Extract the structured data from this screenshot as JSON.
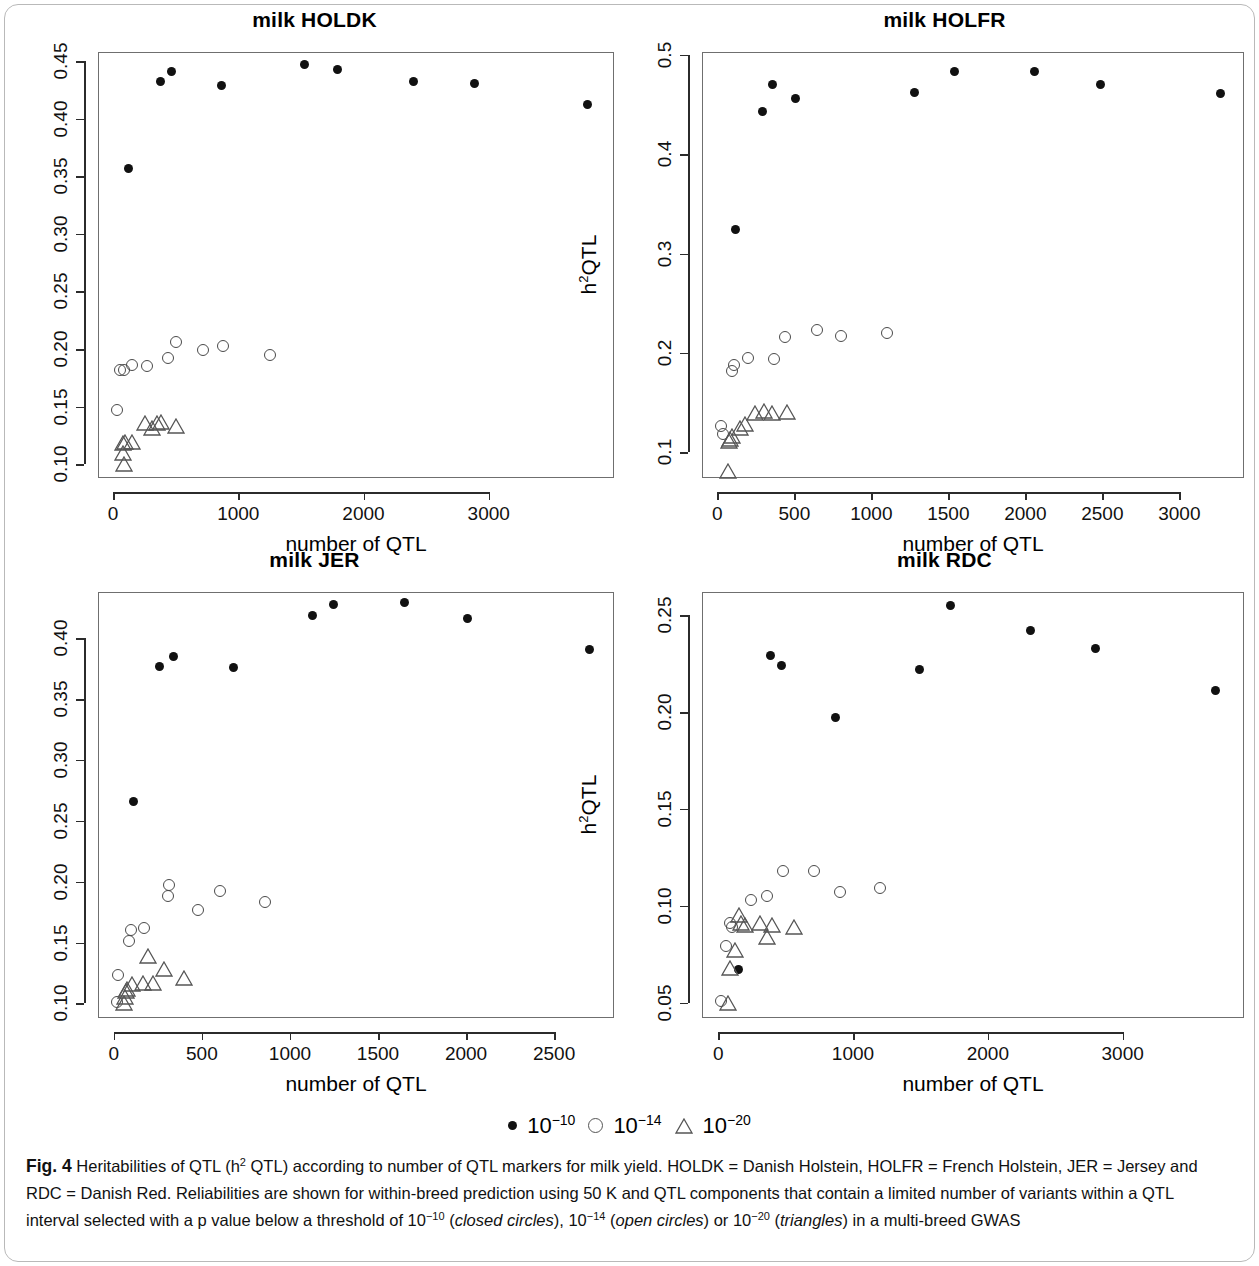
{
  "figure": {
    "label": "Fig. 4",
    "caption_part1": "Heritabilities of QTL (h",
    "caption_sup1": "2",
    "caption_part2": " QTL) according to number of QTL markers for milk yield. HOLDK = Danish Holstein, HOLFR = French Holstein, JER = Jersey and RDC = Danish Red. Reliabilities are shown for within-breed prediction using 50 K and QTL components that contain a limited number of variants within a QTL interval selected with a p value below a threshold of 10",
    "caption_sup2": "−10",
    "caption_part3": " (",
    "caption_italic1": "closed circles",
    "caption_part4": "), 10",
    "caption_sup3": "−14",
    "caption_part5": " (",
    "caption_italic2": "open circles",
    "caption_part6": ") or 10",
    "caption_sup4": "−20",
    "caption_part7": " (",
    "caption_italic3": "triangles",
    "caption_part8": ") in a multi-breed GWAS"
  },
  "legend": {
    "items": [
      {
        "marker": "closed-circle",
        "base": "10",
        "exp": "−10"
      },
      {
        "marker": "open-circle",
        "base": "10",
        "exp": "−14"
      },
      {
        "marker": "triangle",
        "base": "10",
        "exp": "−20"
      }
    ]
  },
  "chart_data": [
    {
      "type": "scatter",
      "title": "milk HOLDK",
      "xlabel": "number of QTL",
      "ylabel": "h²QTL",
      "xlim": [
        -120,
        4000
      ],
      "ylim": [
        0.088,
        0.458
      ],
      "xticks": [
        0,
        1000,
        2000,
        3000
      ],
      "yticks": [
        0.1,
        0.15,
        0.2,
        0.25,
        0.3,
        0.35,
        0.4,
        0.45
      ],
      "yticklabels": [
        "0.10",
        "0.15",
        "0.20",
        "0.25",
        "0.30",
        "0.35",
        "0.40",
        "0.45"
      ],
      "xticklabels": [
        "0",
        "1000",
        "2000",
        "3000"
      ],
      "grid": false,
      "series": [
        {
          "name": "10-10",
          "marker": "closed-circle",
          "points": [
            [
              120,
              0.357
            ],
            [
              380,
              0.432
            ],
            [
              470,
              0.441
            ],
            [
              870,
              0.429
            ],
            [
              1530,
              0.447
            ],
            [
              1790,
              0.443
            ],
            [
              2400,
              0.432
            ],
            [
              2890,
              0.431
            ],
            [
              3790,
              0.412
            ]
          ]
        },
        {
          "name": "10-14",
          "marker": "open-circle",
          "points": [
            [
              30,
              0.147
            ],
            [
              55,
              0.182
            ],
            [
              85,
              0.182
            ],
            [
              150,
              0.186
            ],
            [
              270,
              0.185
            ],
            [
              440,
              0.192
            ],
            [
              500,
              0.206
            ],
            [
              720,
              0.199
            ],
            [
              880,
              0.203
            ],
            [
              1250,
              0.195
            ]
          ]
        },
        {
          "name": "10-20",
          "marker": "triangle",
          "points": [
            [
              20,
              0.1
            ],
            [
              18,
              0.11
            ],
            [
              15,
              0.118
            ],
            [
              30,
              0.119
            ],
            [
              90,
              0.119
            ],
            [
              190,
              0.136
            ],
            [
              250,
              0.131
            ],
            [
              290,
              0.136
            ],
            [
              320,
              0.137
            ],
            [
              440,
              0.133
            ]
          ]
        }
      ]
    },
    {
      "type": "scatter",
      "title": "milk HOLFR",
      "xlabel": "number of QTL",
      "ylabel": "h²QTL",
      "xlim": [
        -100,
        3420
      ],
      "ylim": [
        0.074,
        0.503
      ],
      "xticks": [
        0,
        500,
        1000,
        1500,
        2000,
        2500,
        3000
      ],
      "yticks": [
        0.1,
        0.2,
        0.3,
        0.4,
        0.5
      ],
      "yticklabels": [
        "0.1",
        "0.2",
        "0.3",
        "0.4",
        "0.5"
      ],
      "xticklabels": [
        "0",
        "500",
        "1000",
        "1500",
        "2000",
        "2500",
        "3000"
      ],
      "grid": false,
      "series": [
        {
          "name": "10-10",
          "marker": "closed-circle",
          "points": [
            [
              120,
              0.324
            ],
            [
              290,
              0.443
            ],
            [
              360,
              0.47
            ],
            [
              510,
              0.456
            ],
            [
              1280,
              0.462
            ],
            [
              1540,
              0.483
            ],
            [
              2060,
              0.483
            ],
            [
              2490,
              0.47
            ],
            [
              3270,
              0.461
            ]
          ]
        },
        {
          "name": "10-14",
          "marker": "open-circle",
          "points": [
            [
              25,
              0.126
            ],
            [
              35,
              0.118
            ],
            [
              95,
              0.182
            ],
            [
              110,
              0.188
            ],
            [
              200,
              0.195
            ],
            [
              370,
              0.194
            ],
            [
              440,
              0.216
            ],
            [
              650,
              0.223
            ],
            [
              800,
              0.217
            ],
            [
              1100,
              0.22
            ]
          ]
        },
        {
          "name": "10-20",
          "marker": "triangle",
          "points": [
            [
              20,
              0.081
            ],
            [
              25,
              0.111
            ],
            [
              30,
              0.113
            ],
            [
              40,
              0.116
            ],
            [
              95,
              0.124
            ],
            [
              130,
              0.128
            ],
            [
              190,
              0.139
            ],
            [
              250,
              0.141
            ],
            [
              300,
              0.139
            ],
            [
              400,
              0.14
            ]
          ]
        }
      ]
    },
    {
      "type": "scatter",
      "title": "milk JER",
      "xlabel": "number of QTL",
      "ylabel": "h²QTL",
      "xlim": [
        -90,
        2840
      ],
      "ylim": [
        0.088,
        0.438
      ],
      "xticks": [
        0,
        500,
        1000,
        1500,
        2000,
        2500
      ],
      "yticks": [
        0.1,
        0.15,
        0.2,
        0.25,
        0.3,
        0.35,
        0.4
      ],
      "yticklabels": [
        "0.10",
        "0.15",
        "0.20",
        "0.25",
        "0.30",
        "0.35",
        "0.40"
      ],
      "xticklabels": [
        "0",
        "500",
        "1000",
        "1500",
        "2000",
        "2500"
      ],
      "grid": false,
      "series": [
        {
          "name": "10-10",
          "marker": "closed-circle",
          "points": [
            [
              110,
              0.266
            ],
            [
              260,
              0.377
            ],
            [
              340,
              0.385
            ],
            [
              680,
              0.376
            ],
            [
              1130,
              0.419
            ],
            [
              1250,
              0.428
            ],
            [
              1650,
              0.429
            ],
            [
              2010,
              0.416
            ],
            [
              2700,
              0.391
            ]
          ]
        },
        {
          "name": "10-14",
          "marker": "open-circle",
          "points": [
            [
              20,
              0.101
            ],
            [
              25,
              0.123
            ],
            [
              85,
              0.151
            ],
            [
              95,
              0.16
            ],
            [
              170,
              0.162
            ],
            [
              310,
              0.188
            ],
            [
              315,
              0.197
            ],
            [
              480,
              0.177
            ],
            [
              600,
              0.192
            ],
            [
              860,
              0.183
            ]
          ]
        },
        {
          "name": "10-20",
          "marker": "triangle",
          "points": [
            [
              15,
              0.1
            ],
            [
              20,
              0.105
            ],
            [
              25,
              0.11
            ],
            [
              30,
              0.112
            ],
            [
              60,
              0.116
            ],
            [
              120,
              0.117
            ],
            [
              175,
              0.117
            ],
            [
              150,
              0.139
            ],
            [
              240,
              0.128
            ],
            [
              355,
              0.121
            ]
          ]
        }
      ]
    },
    {
      "type": "scatter",
      "title": "milk RDC",
      "xlabel": "number of QTL",
      "ylabel": "h²QTL",
      "xlim": [
        -120,
        3900
      ],
      "ylim": [
        0.042,
        0.262
      ],
      "xticks": [
        0,
        1000,
        2000,
        3000
      ],
      "yticks": [
        0.05,
        0.1,
        0.15,
        0.2,
        0.25
      ],
      "yticklabels": [
        "0.05",
        "0.10",
        "0.15",
        "0.20",
        "0.25"
      ],
      "xticklabels": [
        "0",
        "1000",
        "2000",
        "3000"
      ],
      "grid": false,
      "series": [
        {
          "name": "10-10",
          "marker": "closed-circle",
          "points": [
            [
              150,
              0.067
            ],
            [
              390,
              0.229
            ],
            [
              470,
              0.224
            ],
            [
              870,
              0.197
            ],
            [
              1490,
              0.222
            ],
            [
              1720,
              0.255
            ],
            [
              2320,
              0.242
            ],
            [
              2800,
              0.233
            ],
            [
              3690,
              0.211
            ]
          ]
        },
        {
          "name": "10-14",
          "marker": "open-circle",
          "points": [
            [
              20,
              0.051
            ],
            [
              60,
              0.079
            ],
            [
              90,
              0.091
            ],
            [
              100,
              0.089
            ],
            [
              240,
              0.103
            ],
            [
              360,
              0.105
            ],
            [
              480,
              0.118
            ],
            [
              710,
              0.118
            ],
            [
              900,
              0.107
            ],
            [
              1200,
              0.109
            ]
          ]
        },
        {
          "name": "10-20",
          "marker": "triangle",
          "points": [
            [
              15,
              0.05
            ],
            [
              30,
              0.068
            ],
            [
              65,
              0.077
            ],
            [
              95,
              0.095
            ],
            [
              110,
              0.091
            ],
            [
              140,
              0.09
            ],
            [
              250,
              0.091
            ],
            [
              300,
              0.084
            ],
            [
              340,
              0.09
            ],
            [
              500,
              0.089
            ]
          ]
        }
      ]
    }
  ]
}
